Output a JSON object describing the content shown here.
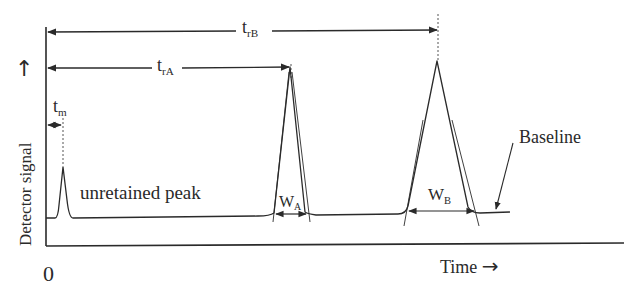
{
  "diagram": {
    "axes": {
      "y_label": "Detector signal",
      "y_arrow": "↑",
      "x_label": "Time",
      "x_arrow": "→",
      "origin_label": "0"
    },
    "labels": {
      "t_m": {
        "main": "t",
        "sub": "m"
      },
      "t_rA": {
        "main": "t",
        "sub": "rA"
      },
      "t_rB": {
        "main": "t",
        "sub": "rB"
      },
      "w_A": {
        "main": "W",
        "sub": "A"
      },
      "w_B": {
        "main": "W",
        "sub": "B"
      },
      "unretained_peak": "unretained peak",
      "baseline": "Baseline"
    },
    "peaks": [
      {
        "name": "unretained",
        "apex_x": 63,
        "apex_y": 165,
        "height": "small"
      },
      {
        "name": "A",
        "apex_x": 290,
        "apex_y": 66,
        "width_label": "W_A"
      },
      {
        "name": "B",
        "apex_x": 437,
        "apex_y": 60,
        "width_label": "W_B"
      }
    ],
    "colors": {
      "line": "#2a2a2a",
      "background": "#ffffff"
    }
  }
}
